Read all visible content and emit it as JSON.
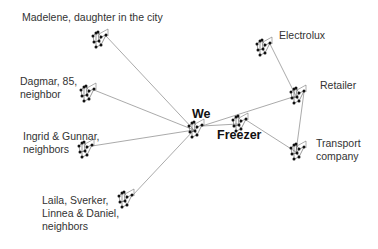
{
  "diagram": {
    "type": "network",
    "edge_color": "#a0a0a0",
    "node_color": "#111111",
    "nodes": [
      {
        "id": "madelene",
        "label": "Madelene, daughter in the city",
        "x": 100,
        "y": 38,
        "label_x": 22,
        "label_y": 11,
        "bold": false
      },
      {
        "id": "dagmar",
        "label": "Dagmar, 85,\nneighbor",
        "x": 88,
        "y": 92,
        "label_x": 20,
        "label_y": 75,
        "bold": false
      },
      {
        "id": "ingrid",
        "label": "Ingrid & Gunnar,\nneighbors",
        "x": 86,
        "y": 148,
        "label_x": 23,
        "label_y": 130,
        "bold": false
      },
      {
        "id": "laila",
        "label": "Laila, Sverker,\nLinnea & Daniel,\nneighbors",
        "x": 126,
        "y": 198,
        "label_x": 42,
        "label_y": 194,
        "bold": false
      },
      {
        "id": "we",
        "label": "We",
        "x": 196,
        "y": 128,
        "label_x": 192,
        "label_y": 107,
        "bold": true
      },
      {
        "id": "freezer",
        "label": "Freezer",
        "x": 240,
        "y": 122,
        "label_x": 217,
        "label_y": 128,
        "bold": true
      },
      {
        "id": "electrolux",
        "label": "Electrolux",
        "x": 264,
        "y": 46,
        "label_x": 279,
        "label_y": 29,
        "bold": false
      },
      {
        "id": "retailer",
        "label": "Retailer",
        "x": 298,
        "y": 94,
        "label_x": 320,
        "label_y": 79,
        "bold": false
      },
      {
        "id": "transport",
        "label": "Transport\ncompany",
        "x": 298,
        "y": 150,
        "label_x": 316,
        "label_y": 137,
        "bold": false
      }
    ],
    "edges": [
      [
        "madelene",
        "we"
      ],
      [
        "dagmar",
        "we"
      ],
      [
        "ingrid",
        "we"
      ],
      [
        "laila",
        "we"
      ],
      [
        "we",
        "freezer"
      ],
      [
        "we",
        "retailer"
      ],
      [
        "electrolux",
        "retailer"
      ],
      [
        "retailer",
        "transport"
      ],
      [
        "freezer",
        "transport"
      ]
    ]
  },
  "labels": {
    "madelene": "Madelene, daughter in the city",
    "dagmar": "Dagmar, 85,\nneighbor",
    "ingrid": "Ingrid & Gunnar,\nneighbors",
    "laila": "Laila, Sverker,\nLinnea & Daniel,\nneighbors",
    "we": "We",
    "freezer": "Freezer",
    "electrolux": "Electrolux",
    "retailer": "Retailer",
    "transport": "Transport\ncompany"
  }
}
